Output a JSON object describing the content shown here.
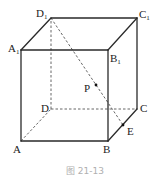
{
  "figure": {
    "caption": "图 21-13",
    "type": "cube",
    "vertices": {
      "A": {
        "label": "A",
        "x": 21,
        "y": 141
      },
      "B": {
        "label": "B",
        "x": 108,
        "y": 141
      },
      "C": {
        "label": "C",
        "x": 137,
        "y": 109
      },
      "D": {
        "label": "D",
        "x": 51,
        "y": 109
      },
      "A1": {
        "label": "A",
        "sub": "1",
        "x": 21,
        "y": 50
      },
      "B1": {
        "label": "B",
        "sub": "1",
        "x": 108,
        "y": 50
      },
      "C1": {
        "label": "C",
        "sub": "1",
        "x": 137,
        "y": 18
      },
      "D1": {
        "label": "D",
        "sub": "1",
        "x": 51,
        "y": 18
      }
    },
    "points": {
      "P": {
        "label": "P",
        "x": 96,
        "y": 85
      },
      "E": {
        "label": "E",
        "x": 123,
        "y": 125
      }
    },
    "solid_edges": [
      "AB",
      "BC",
      "CC1",
      "A1B1",
      "B1C1",
      "C1D1",
      "D1A1",
      "AA1",
      "BB1"
    ],
    "dashed_edges": [
      "AD",
      "DC",
      "DD1",
      "D1E"
    ]
  }
}
